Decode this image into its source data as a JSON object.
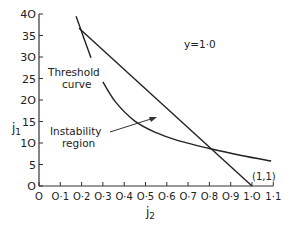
{
  "chart_data": {
    "type": "line",
    "title": "",
    "annotation_param": "y=1·0",
    "xlabel": "j2",
    "ylabel": "j1",
    "xlim": [
      0,
      1.1
    ],
    "ylim": [
      0,
      40
    ],
    "grid": false,
    "x_ticks": [
      "O",
      "O·1",
      "O·2",
      "O·3",
      "O·4",
      "O·5",
      "O·6",
      "O·7",
      "O·8",
      "O·9",
      "1·O",
      "1·1"
    ],
    "x_tick_values": [
      0,
      0.1,
      0.2,
      0.3,
      0.4,
      0.5,
      0.6,
      0.7,
      0.8,
      0.9,
      1.0,
      1.1
    ],
    "y_ticks": [
      "O",
      "5",
      "1O",
      "15",
      "2O",
      "25",
      "3O",
      "35",
      "4O"
    ],
    "y_tick_values": [
      0,
      5,
      10,
      15,
      20,
      25,
      30,
      35,
      40
    ],
    "series": [
      {
        "name": "Threshold curve",
        "x": [
          0.174,
          0.21,
          0.244,
          0.3,
          0.36,
          0.45,
          0.55,
          0.65,
          0.81,
          0.95,
          1.09
        ],
        "y": [
          39.5,
          34.5,
          29.8,
          24.2,
          19.5,
          15.1,
          12.4,
          10.6,
          8.6,
          7.1,
          5.8
        ]
      },
      {
        "name": "Straight line",
        "x": [
          0.188,
          0.4,
          0.6,
          0.81,
          1.0
        ],
        "y": [
          36.7,
          27.1,
          18.0,
          8.5,
          0
        ]
      }
    ],
    "annotations": [
      {
        "text": "Threshold curve",
        "lines": [
          "Threshold",
          "curve"
        ]
      },
      {
        "text": "Instability region",
        "lines": [
          "Instability",
          "region"
        ],
        "arrow_to": [
          0.55,
          16.0
        ]
      },
      {
        "text": "y=1·0"
      },
      {
        "text": "(1,1)",
        "at": [
          1.0,
          0
        ]
      }
    ]
  },
  "labels": {
    "y_axis": "j",
    "y_axis_sub": "1",
    "x_axis": "j",
    "x_axis_sub": "2",
    "param": "y=1·0",
    "threshold_line1": "Threshold",
    "threshold_line2": "curve",
    "instability_line1": "Instability",
    "instability_line2": "region",
    "point": "(1,1)"
  }
}
